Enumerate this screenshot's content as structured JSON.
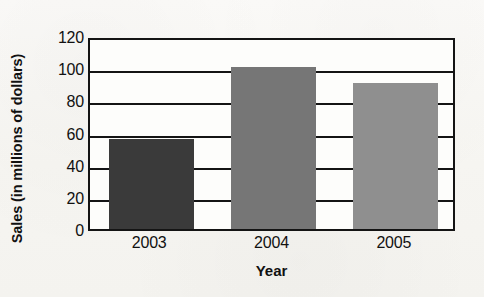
{
  "chart_data": {
    "type": "bar",
    "title": "",
    "subtitle": "",
    "categories": [
      "2003",
      "2004",
      "2005"
    ],
    "values": [
      57,
      102,
      92
    ],
    "xlabel": "Year",
    "ylabel": "Sales (in millions of dollars)",
    "ylim": [
      0,
      120
    ],
    "yticks": [
      120,
      100,
      80,
      60,
      40,
      20,
      0
    ],
    "ytick_labels": [
      "120",
      "100",
      "80",
      "60",
      "40",
      "20",
      "0"
    ],
    "grid": true,
    "grid_axis": "y",
    "legend": false,
    "legend_position": "none",
    "bar_colors": [
      "#3a3a3a",
      "#767676",
      "#8f8f8f"
    ],
    "annotations": [],
    "series": [
      {
        "name": "Sales",
        "values": [
          57,
          102,
          92
        ]
      }
    ]
  },
  "style": {
    "background_color": "#f8f7f4",
    "plot_background_color": "#fdfdfb",
    "axis_color": "#141414",
    "text_color": "#111111"
  }
}
